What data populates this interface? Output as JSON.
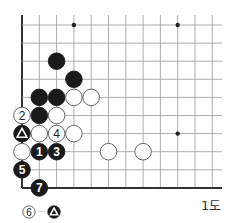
{
  "diagram": {
    "caption": "1도",
    "board": {
      "cols": 12,
      "rows": 10,
      "origin_x": 22,
      "origin_y": 25,
      "spacing_x": 17.3,
      "spacing_y": 18.1,
      "top_open_y": 15,
      "right_open_x": 222,
      "left_edge": true,
      "bottom_edge": true,
      "star_points": [
        {
          "col": 3,
          "row": 0
        },
        {
          "col": 9,
          "row": 0
        },
        {
          "col": 9,
          "row": 6
        }
      ]
    },
    "stones": [
      {
        "col": 2,
        "row": 2,
        "color": "black",
        "label": ""
      },
      {
        "col": 3,
        "row": 3,
        "color": "black",
        "label": ""
      },
      {
        "col": 1,
        "row": 4,
        "color": "black",
        "label": ""
      },
      {
        "col": 2,
        "row": 4,
        "color": "black",
        "label": ""
      },
      {
        "col": 3,
        "row": 4,
        "color": "white",
        "label": ""
      },
      {
        "col": 4,
        "row": 4,
        "color": "white",
        "label": ""
      },
      {
        "col": 0,
        "row": 5,
        "color": "white",
        "label": "2"
      },
      {
        "col": 1,
        "row": 5,
        "color": "black",
        "label": ""
      },
      {
        "col": 2,
        "row": 5,
        "color": "white",
        "label": ""
      },
      {
        "col": 0,
        "row": 6,
        "color": "black",
        "label": "triangle"
      },
      {
        "col": 1,
        "row": 6,
        "color": "white",
        "label": ""
      },
      {
        "col": 2,
        "row": 6,
        "color": "white",
        "label": "4"
      },
      {
        "col": 3,
        "row": 6,
        "color": "white",
        "label": ""
      },
      {
        "col": 0,
        "row": 7,
        "color": "white",
        "label": ""
      },
      {
        "col": 1,
        "row": 7,
        "color": "black",
        "label": "1"
      },
      {
        "col": 2,
        "row": 7,
        "color": "black",
        "label": "3"
      },
      {
        "col": 5,
        "row": 7,
        "color": "white",
        "label": ""
      },
      {
        "col": 7,
        "row": 7,
        "color": "white",
        "label": ""
      },
      {
        "col": 0,
        "row": 8,
        "color": "black",
        "label": "5"
      },
      {
        "col": 1,
        "row": 9,
        "color": "black",
        "label": "7"
      }
    ],
    "note": {
      "from": {
        "color": "white",
        "label": "6"
      },
      "connector": "···",
      "to": {
        "color": "black",
        "label": "triangle"
      }
    }
  }
}
